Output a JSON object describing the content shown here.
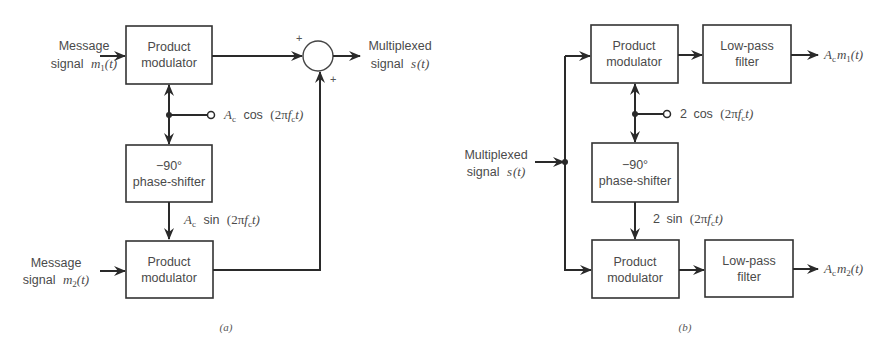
{
  "diagram_a": {
    "caption": "(a)",
    "input1": {
      "line1": "Message",
      "line2_prefix": "signal",
      "var": "m",
      "sub": "1",
      "arg": "(t)"
    },
    "input2": {
      "line1": "Message",
      "line2_prefix": "signal",
      "var": "m",
      "sub": "2",
      "arg": "(t)"
    },
    "top_modulator": {
      "line1": "Product",
      "line2": "modulator"
    },
    "bottom_modulator": {
      "line1": "Product",
      "line2": "modulator"
    },
    "phase_shifter": {
      "line1": "−90°",
      "line2": "phase-shifter"
    },
    "carrier_cos": {
      "amp": "A",
      "amp_sub": "c",
      "func": "cos",
      "arg_open": "(2π",
      "f": "f",
      "f_sub": "c",
      "arg_close": "t)"
    },
    "carrier_sin": {
      "amp": "A",
      "amp_sub": "c",
      "func": "sin",
      "arg_open": "(2π",
      "f": "f",
      "f_sub": "c",
      "arg_close": "t)"
    },
    "summer": {
      "plus_top": "+",
      "plus_bottom": "+"
    },
    "output": {
      "line1": "Multiplexed",
      "line2_prefix": "signal",
      "var": "s",
      "arg": "(t)"
    }
  },
  "diagram_b": {
    "caption": "(b)",
    "input": {
      "line1": "Multiplexed",
      "line2_prefix": "signal",
      "var": "s",
      "arg": "(t)"
    },
    "top_modulator": {
      "line1": "Product",
      "line2": "modulator"
    },
    "bottom_modulator": {
      "line1": "Product",
      "line2": "modulator"
    },
    "top_filter": {
      "line1": "Low-pass",
      "line2": "filter"
    },
    "bottom_filter": {
      "line1": "Low-pass",
      "line2": "filter"
    },
    "phase_shifter": {
      "line1": "−90°",
      "line2": "phase-shifter"
    },
    "carrier_cos": {
      "amp": "2",
      "func": "cos",
      "arg_open": "(2π",
      "f": "f",
      "f_sub": "c",
      "arg_close": "t)"
    },
    "carrier_sin": {
      "amp": "2",
      "func": "sin",
      "arg_open": "(2π",
      "f": "f",
      "f_sub": "c",
      "arg_close": "t)"
    },
    "output1": {
      "amp": "A",
      "amp_sub": "c",
      "var": "m",
      "sub": "1",
      "arg": "(t)"
    },
    "output2": {
      "amp": "A",
      "amp_sub": "c",
      "var": "m",
      "sub": "2",
      "arg": "(t)"
    }
  }
}
